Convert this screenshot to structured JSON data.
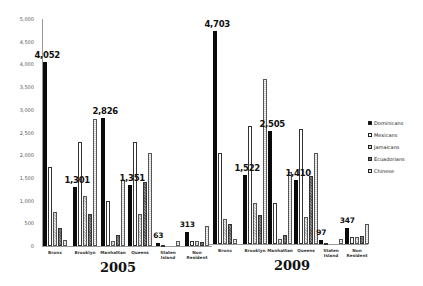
{
  "chart_data": [
    {
      "type": "bar",
      "title": "2005",
      "xlabel": "",
      "ylabel": "",
      "ylim": [
        0,
        5000
      ],
      "yticks": [
        "0",
        "500",
        "1,000",
        "1,500",
        "2,000",
        "2,500",
        "3,000",
        "3,500",
        "4,000",
        "4,500",
        "5,000"
      ],
      "grid": false,
      "legend_position": "right",
      "categories": [
        "Bronx",
        "Brooklyn",
        "Manhattan",
        "Queens",
        "Staten Island",
        "Non Resident"
      ],
      "series": [
        {
          "name": "Dominicans",
          "values": [
            4052,
            1301,
            2826,
            1351,
            63,
            313
          ]
        },
        {
          "name": "Mexicans",
          "values": [
            1750,
            2300,
            1000,
            2300,
            10,
            100
          ]
        },
        {
          "name": "Jamaicans",
          "values": [
            750,
            1100,
            100,
            700,
            0,
            120
          ]
        },
        {
          "name": "Ecuadorians",
          "values": [
            400,
            700,
            250,
            1400,
            0,
            80
          ]
        },
        {
          "name": "Chinese",
          "values": [
            130,
            2800,
            1450,
            2050,
            100,
            450
          ]
        }
      ],
      "data_labels": [
        "4,052",
        "1,301",
        "2,826",
        "1,351",
        "63",
        "313"
      ]
    },
    {
      "type": "bar",
      "title": "2009",
      "xlabel": "",
      "ylabel": "",
      "ylim": [
        0,
        5000
      ],
      "grid": false,
      "legend_position": "right",
      "categories": [
        "Bronx",
        "Brooklyn",
        "Manhattan",
        "Queens",
        "Staten Island",
        "Non Resident"
      ],
      "series": [
        {
          "name": "Dominicans",
          "values": [
            4703,
            1522,
            2505,
            1410,
            97,
            347
          ]
        },
        {
          "name": "Mexicans",
          "values": [
            2000,
            2600,
            900,
            2550,
            20,
            150
          ]
        },
        {
          "name": "Jamaicans",
          "values": [
            550,
            900,
            100,
            600,
            0,
            150
          ]
        },
        {
          "name": "Ecuadorians",
          "values": [
            450,
            650,
            200,
            1500,
            0,
            180
          ]
        },
        {
          "name": "Chinese",
          "values": [
            100,
            3650,
            1600,
            2000,
            120,
            450
          ]
        }
      ],
      "data_labels": [
        "4,703",
        "1,522",
        "2,505",
        "1,410",
        "97",
        "347"
      ]
    }
  ],
  "legend": [
    "Dominicans",
    "Mexicans",
    "Jamaicans",
    "Ecuadorians",
    "Chinese"
  ],
  "years": [
    "2005",
    "2009"
  ],
  "category_labels": [
    [
      "Bronx"
    ],
    [
      "Brooklyn"
    ],
    [
      "Manhattan"
    ],
    [
      "Queens"
    ],
    [
      "Staten",
      "Island"
    ],
    [
      "Non",
      "Resident"
    ]
  ]
}
